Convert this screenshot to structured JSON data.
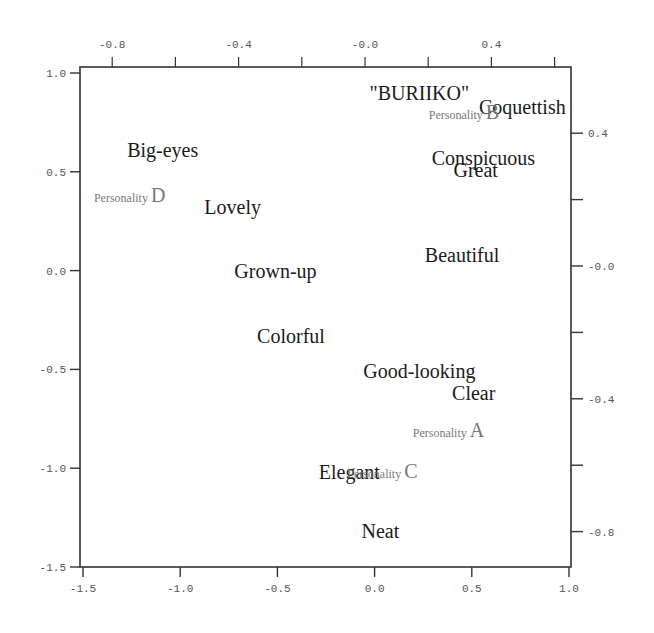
{
  "chart_data": {
    "type": "scatter",
    "title": "",
    "xlabel": "",
    "ylabel": "",
    "grid": false,
    "legend": null,
    "axes": {
      "bottom": {
        "range": [
          -1.5,
          1.0
        ],
        "ticks": [
          "-1.5",
          "-1.0",
          "-0.5",
          "0.0",
          "0.5",
          "1.0"
        ]
      },
      "left": {
        "range": [
          -1.5,
          1.0
        ],
        "ticks": [
          "1.0",
          "0.5",
          "0.0",
          "-0.5",
          "-1.0",
          "-1.5"
        ]
      },
      "top": {
        "range": [
          -0.9,
          0.65
        ],
        "ticks": [
          "-0.8",
          "-0.4",
          "-0.0",
          "0.4"
        ],
        "minor_ticks": [
          "-0.6",
          "-0.2",
          "0.2",
          "0.6"
        ]
      },
      "right": {
        "range": [
          -0.9,
          0.6
        ],
        "ticks": [
          "0.4",
          "-0.0",
          "-0.4",
          "-0.8"
        ],
        "minor_ticks": [
          "0.2",
          "-0.2",
          "-0.6"
        ]
      }
    },
    "series": [
      {
        "name": "Adjectives",
        "points": [
          {
            "label": "\"BURIIKO\"",
            "x": 0.23,
            "y": 0.9
          },
          {
            "label": "Coquettish",
            "x": 0.76,
            "y": 0.83
          },
          {
            "label": "Big-eyes",
            "x": -1.09,
            "y": 0.61
          },
          {
            "label": "Conspicuous",
            "x": 0.56,
            "y": 0.57
          },
          {
            "label": "Great",
            "x": 0.52,
            "y": 0.51
          },
          {
            "label": "Lovely",
            "x": -0.73,
            "y": 0.32
          },
          {
            "label": "Beautiful",
            "x": 0.45,
            "y": 0.08
          },
          {
            "label": "Grown-up",
            "x": -0.51,
            "y": 0.0
          },
          {
            "label": "Colorful",
            "x": -0.43,
            "y": -0.33
          },
          {
            "label": "Good-looking",
            "x": 0.23,
            "y": -0.51
          },
          {
            "label": "Clear",
            "x": 0.51,
            "y": -0.62
          },
          {
            "label": "Elegant",
            "x": -0.13,
            "y": -1.02
          },
          {
            "label": "Neat",
            "x": 0.03,
            "y": -1.32
          }
        ]
      },
      {
        "name": "Personalities",
        "points": [
          {
            "label": "Personality B",
            "prefix": "Personality",
            "letter": "B",
            "x": 0.46,
            "y": 0.8
          },
          {
            "label": "Personality D",
            "prefix": "Personality",
            "letter": "D",
            "x": -1.26,
            "y": 0.38
          },
          {
            "label": "Personality A",
            "prefix": "Personality",
            "letter": "A",
            "x": 0.38,
            "y": -0.81
          },
          {
            "label": "Personality C",
            "prefix": "Personality",
            "letter": "C",
            "x": 0.04,
            "y": -1.02
          }
        ]
      }
    ]
  },
  "colors": {
    "axis": "#333333",
    "tick_text": "#555555",
    "word_text": "#1a1a1a",
    "personality_text": "#777777",
    "background": "#ffffff"
  }
}
